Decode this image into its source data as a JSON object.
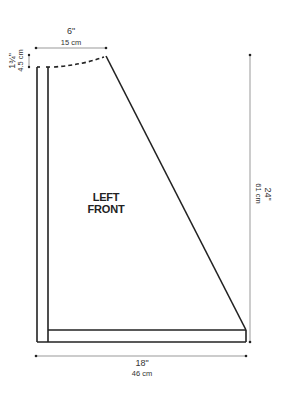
{
  "diagram": {
    "piece_label_line1": "LEFT",
    "piece_label_line2": "FRONT",
    "dimensions": {
      "top_width": {
        "inches": "6\"",
        "cm": "15 cm"
      },
      "neck_drop": {
        "inches": "1¾\"",
        "cm": "4.5 cm"
      },
      "length": {
        "inches": "24\"",
        "cm": "61 cm"
      },
      "bottom_width": {
        "inches": "18\"",
        "cm": "46 cm"
      }
    },
    "colors": {
      "outline": "#222222",
      "dimension_line": "#999999",
      "text": "#333333"
    }
  }
}
